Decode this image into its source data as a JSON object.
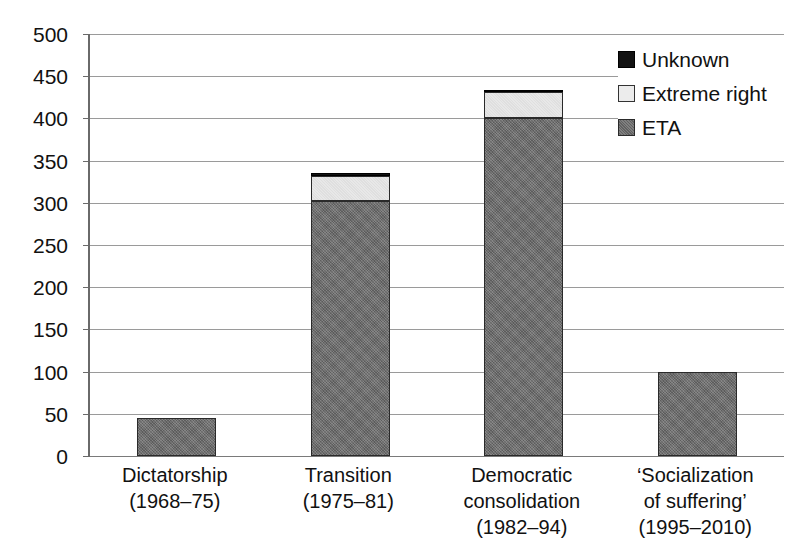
{
  "chart_data": {
    "type": "bar",
    "stacked": true,
    "title": "",
    "xlabel": "",
    "ylabel": "",
    "ylim": [
      0,
      500
    ],
    "ytick_step": 50,
    "yticks": [
      0,
      50,
      100,
      150,
      200,
      250,
      300,
      350,
      400,
      450,
      500
    ],
    "grid": true,
    "legend_position": "top-right",
    "categories": [
      "Dictatorship (1968–75)",
      "Transition (1975–81)",
      "Democratic consolidation (1982–94)",
      "‘Socialization of suffering’ (1995–2010)"
    ],
    "category_lines": [
      [
        "Dictatorship",
        "(1968–75)"
      ],
      [
        "Transition",
        "(1975–81)"
      ],
      [
        "Democratic",
        "consolidation",
        "(1982–94)"
      ],
      [
        "‘Socialization",
        "of suffering’",
        "(1995–2010)"
      ]
    ],
    "series": [
      {
        "name": "ETA",
        "color": "#6e6e6e",
        "values": [
          45,
          302,
          401,
          99
        ]
      },
      {
        "name": "Extreme right",
        "color": "#e7e7e7",
        "values": [
          0,
          30,
          30,
          0
        ]
      },
      {
        "name": "Unknown",
        "color": "#121212",
        "values": [
          0,
          3,
          3,
          0
        ]
      }
    ],
    "totals": [
      45,
      335,
      434,
      99
    ],
    "legend_order": [
      "Unknown",
      "Extreme right",
      "ETA"
    ]
  },
  "legend": {
    "items": [
      {
        "label": "Unknown",
        "swatch": "legend-swatch-unknown"
      },
      {
        "label": "Extreme right",
        "swatch": "legend-swatch-extreme-right"
      },
      {
        "label": "ETA",
        "swatch": "legend-swatch-eta"
      }
    ]
  },
  "axes": {
    "y_tick_labels": [
      "500",
      "450",
      "400",
      "350",
      "300",
      "250",
      "200",
      "150",
      "100",
      "50",
      "0"
    ]
  }
}
